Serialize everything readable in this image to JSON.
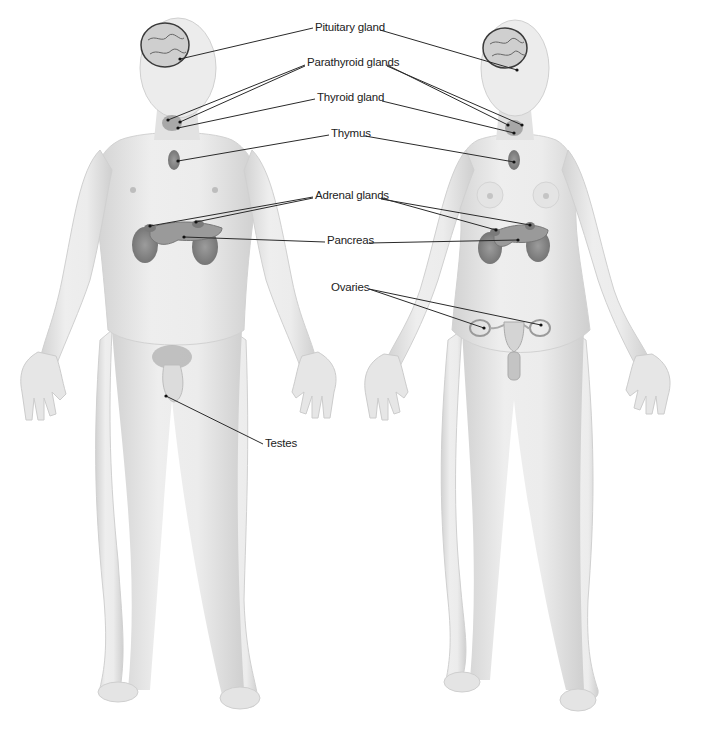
{
  "diagram": {
    "figures": [
      {
        "id": "male",
        "label_visible": false
      },
      {
        "id": "female",
        "label_visible": false
      }
    ],
    "labels": [
      {
        "id": "pituitary",
        "text": "Pituitary gland",
        "x": 315,
        "y": 22
      },
      {
        "id": "parathyroid",
        "text": "Parathyroid glands",
        "x": 307,
        "y": 57
      },
      {
        "id": "thyroid",
        "text": "Thyroid gland",
        "x": 317,
        "y": 92
      },
      {
        "id": "thymus",
        "text": "Thymus",
        "x": 331,
        "y": 128
      },
      {
        "id": "adrenal",
        "text": "Adrenal glands",
        "x": 315,
        "y": 190
      },
      {
        "id": "pancreas",
        "text": "Pancreas",
        "x": 327,
        "y": 235
      },
      {
        "id": "ovaries",
        "text": "Ovaries",
        "x": 331,
        "y": 282
      },
      {
        "id": "testes",
        "text": "Testes",
        "x": 265,
        "y": 438
      }
    ],
    "colors": {
      "skin": "#e8e8e8",
      "skin_shadow": "#c9c9c9",
      "organ": "#8a8a8a",
      "organ_dark": "#6a6a6a",
      "leader_line": "#2a2a2a",
      "label_text": "#222222",
      "background": "#ffffff"
    }
  }
}
